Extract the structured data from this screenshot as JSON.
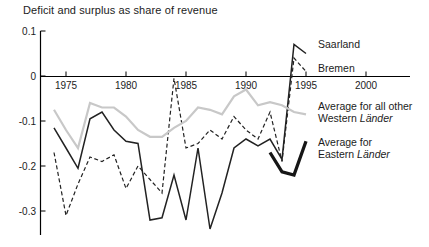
{
  "chart_data": {
    "type": "line",
    "title": "Deficit and surplus as share of revenue",
    "xlabel": "",
    "ylabel": "",
    "grid": false,
    "xlim": [
      1973,
      2003.5
    ],
    "ylim": [
      -0.355,
      0.1
    ],
    "axis_color": "#000000",
    "tick_label_color": "#1c1c1c",
    "x_ticks": [
      {
        "label": "1975",
        "value": 1975
      },
      {
        "label": "1980",
        "value": 1980
      },
      {
        "label": "1985",
        "value": 1985
      },
      {
        "label": "1990",
        "value": 1990
      },
      {
        "label": "1995",
        "value": 1995
      },
      {
        "label": "2000",
        "value": 2000
      }
    ],
    "y_ticks": [
      {
        "label": "0.1",
        "value": 0.1
      },
      {
        "label": "0",
        "value": 0
      },
      {
        "label": "-0.1",
        "value": -0.1
      },
      {
        "label": "-0.2",
        "value": -0.2
      },
      {
        "label": "-0.3",
        "value": -0.3
      }
    ],
    "legend_position": "inline-right-labels",
    "series": [
      {
        "id": "saarland",
        "name": "Saarland",
        "line_style": "solid",
        "color": "#222222",
        "stroke_width": 1.5,
        "years": [
          1974,
          1975,
          1976,
          1977,
          1978,
          1979,
          1980,
          1981,
          1982,
          1983,
          1984,
          1985,
          1986,
          1987,
          1988,
          1989,
          1990,
          1991,
          1992,
          1993,
          1994,
          1995
        ],
        "values": [
          -0.115,
          -0.16,
          -0.205,
          -0.095,
          -0.08,
          -0.12,
          -0.145,
          -0.15,
          -0.32,
          -0.315,
          -0.22,
          -0.32,
          -0.16,
          -0.34,
          -0.26,
          -0.16,
          -0.14,
          -0.155,
          -0.14,
          -0.185,
          0.07,
          0.05
        ],
        "label": {
          "x": 318,
          "y": 48,
          "lines": [
            [
              {
                "t": "Saarland",
                "i": false
              }
            ]
          ]
        }
      },
      {
        "id": "bremen",
        "name": "Bremen",
        "line_style": "dashed",
        "color": "#222222",
        "stroke_width": 1.2,
        "years": [
          1974,
          1975,
          1976,
          1977,
          1978,
          1979,
          1980,
          1981,
          1982,
          1983,
          1984,
          1985,
          1986,
          1987,
          1988,
          1989,
          1990,
          1991,
          1992,
          1993,
          1994,
          1995
        ],
        "values": [
          -0.17,
          -0.31,
          -0.24,
          -0.18,
          -0.19,
          -0.175,
          -0.25,
          -0.2,
          -0.23,
          -0.26,
          -0.005,
          -0.16,
          -0.15,
          -0.12,
          -0.14,
          -0.09,
          -0.12,
          -0.14,
          -0.08,
          -0.19,
          0.04,
          0.01
        ],
        "label": {
          "x": 318,
          "y": 72,
          "lines": [
            [
              {
                "t": "Bremen",
                "i": false
              }
            ]
          ]
        }
      },
      {
        "id": "western-average",
        "name": "Average for all other Western Länder",
        "line_style": "solid",
        "color": "#c8c8c8",
        "stroke_width": 2.2,
        "years": [
          1974,
          1975,
          1976,
          1977,
          1978,
          1979,
          1980,
          1981,
          1982,
          1983,
          1984,
          1985,
          1986,
          1987,
          1988,
          1989,
          1990,
          1991,
          1992,
          1993,
          1994,
          1995
        ],
        "values": [
          -0.075,
          -0.12,
          -0.16,
          -0.06,
          -0.07,
          -0.07,
          -0.09,
          -0.12,
          -0.135,
          -0.135,
          -0.115,
          -0.1,
          -0.07,
          -0.075,
          -0.085,
          -0.045,
          -0.03,
          -0.065,
          -0.058,
          -0.065,
          -0.08,
          -0.085
        ],
        "label": {
          "x": 318,
          "y": 110,
          "lines": [
            [
              {
                "t": "Average for all other",
                "i": false
              }
            ],
            [
              {
                "t": "Western ",
                "i": false
              },
              {
                "t": "Länder",
                "i": true
              }
            ]
          ]
        }
      },
      {
        "id": "eastern-average",
        "name": "Average for Eastern Länder",
        "line_style": "solid",
        "color": "#161616",
        "stroke_width": 3.3,
        "years": [
          1992,
          1993,
          1994,
          1995
        ],
        "values": [
          -0.17,
          -0.213,
          -0.22,
          -0.145
        ],
        "label": {
          "x": 318,
          "y": 146,
          "lines": [
            [
              {
                "t": "Average for",
                "i": false
              }
            ],
            [
              {
                "t": "Eastern ",
                "i": false
              },
              {
                "t": "Länder",
                "i": true
              }
            ]
          ]
        }
      }
    ]
  }
}
